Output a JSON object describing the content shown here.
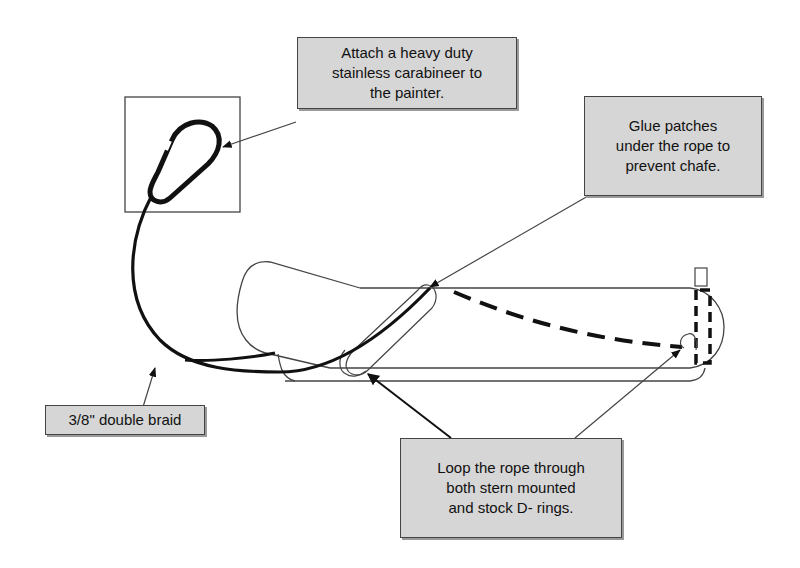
{
  "diagram": {
    "callouts": {
      "carabiner": {
        "lines": [
          "Attach a heavy duty",
          "stainless carabineer to",
          "the painter."
        ]
      },
      "glue_patches": {
        "lines": [
          "Glue patches",
          "under the rope to",
          "prevent chafe."
        ]
      },
      "rope": {
        "lines": [
          "3/8\" double braid"
        ]
      },
      "loop": {
        "lines": [
          "Loop the rope through",
          "both stern mounted",
          "and stock D- rings."
        ]
      }
    },
    "colors": {
      "callout_fill": "#d6d6d6",
      "line": "#111111",
      "outline": "#444444"
    }
  }
}
